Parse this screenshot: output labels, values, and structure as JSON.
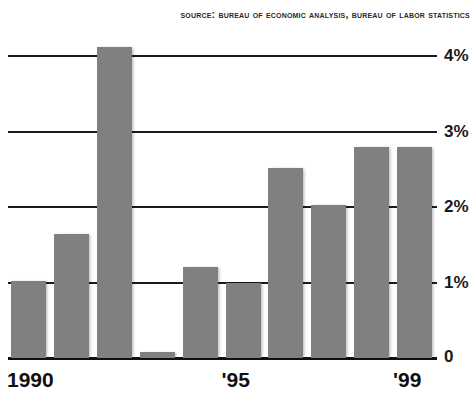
{
  "source": {
    "text": "Source: Bureau of Economic Analysis, Bureau of Labor Statistics"
  },
  "axis": {
    "y_ticks": [
      "1%",
      "2%",
      "3%",
      "4%"
    ],
    "zero_label": "0",
    "x_ticks": [
      "1990",
      "'95",
      "'99"
    ]
  },
  "chart_data": {
    "type": "bar",
    "title": "",
    "subtitle": "",
    "xlabel": "",
    "ylabel": "",
    "categories": [
      "1990",
      "1991",
      "1992",
      "1993",
      "1994",
      "1995",
      "1996",
      "1997",
      "1998",
      "1999"
    ],
    "values": [
      1.02,
      1.64,
      4.12,
      0.08,
      1.21,
      0.99,
      2.52,
      2.03,
      2.79,
      2.79
    ],
    "value_unit": "%",
    "ylim": [
      0,
      4.45
    ],
    "yticks": [
      1,
      2,
      3,
      4
    ],
    "ytick_labels": [
      "1%",
      "2%",
      "3%",
      "4%"
    ],
    "xtick_labels": [
      "1990",
      "'95",
      "'99"
    ],
    "xtick_categories": [
      "1990",
      "1995",
      "1999"
    ],
    "grid": true,
    "grid_axis": "y",
    "legend": false,
    "bar_color": "#808080",
    "axis_color": "#1a1a1a",
    "background": "#ffffff",
    "source_note": "Source: Bureau of Economic Analysis, Bureau of Labor Statistics"
  }
}
